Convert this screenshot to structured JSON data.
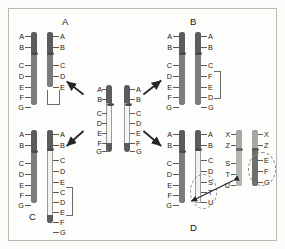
{
  "figure": {
    "background_color": "#fdfdfc",
    "border_color": "#b9b9b4"
  },
  "panels": [
    {
      "id": "panel-a",
      "letter": "A",
      "mutation_type": "deletion",
      "normal_chromosome": {
        "name": "normal",
        "loci": [
          "A",
          "B",
          "C",
          "D",
          "E",
          "F",
          "G"
        ],
        "label_side": "left"
      },
      "mutant_chromosome": {
        "name": "deleted",
        "loci": [
          "A",
          "B",
          "C",
          "D",
          "E"
        ],
        "label_side": "right"
      },
      "bracket_label": "",
      "bracket_covers": [
        "F",
        "G"
      ]
    },
    {
      "id": "panel-b",
      "letter": "B",
      "mutation_type": "inversion",
      "normal_chromosome": {
        "name": "normal",
        "loci": [
          "A",
          "B",
          "C",
          "D",
          "E",
          "F",
          "G"
        ],
        "label_side": "left"
      },
      "mutant_chromosome": {
        "name": "inverted",
        "loci": [
          "A",
          "B",
          "C",
          "F",
          "E",
          "D",
          "G"
        ],
        "label_side": "right"
      },
      "bracket_label": "",
      "bracket_covers": [
        "F",
        "E",
        "D"
      ]
    },
    {
      "id": "panel-c",
      "letter": "C",
      "mutation_type": "duplication",
      "normal_chromosome": {
        "name": "normal",
        "loci": [
          "A",
          "B",
          "C",
          "D",
          "E",
          "F",
          "G"
        ],
        "label_side": "left"
      },
      "mutant_chromosome": {
        "name": "duplicated",
        "loci": [
          "A",
          "B",
          "C",
          "D",
          "E",
          "C",
          "D",
          "E",
          "F",
          "G"
        ],
        "label_side": "right"
      },
      "bracket_label": "",
      "bracket_covers": [
        "C",
        "D",
        "E"
      ]
    },
    {
      "id": "panel-d",
      "letter": "D",
      "mutation_type": "translocation",
      "normal_chromosome": {
        "name": "normal-1",
        "loci": [
          "A",
          "B",
          "C",
          "D",
          "E",
          "F",
          "G"
        ],
        "label_side": "left"
      },
      "mutant_chromosome": {
        "name": "translocated-1",
        "loci": [
          "A",
          "B",
          "C",
          "D",
          "S",
          "T",
          "U"
        ],
        "label_side": "right",
        "highlight": [
          "S",
          "T",
          "U"
        ]
      },
      "partner_normal_chromosome": {
        "name": "normal-2",
        "loci": [
          "X",
          "Z",
          "S",
          "T",
          "U"
        ],
        "label_side": "left"
      },
      "partner_mutant_chromosome": {
        "name": "translocated-2",
        "loci": [
          "X",
          "Z",
          "E",
          "F",
          "G"
        ],
        "label_side": "right",
        "highlight": [
          "E",
          "F",
          "G"
        ]
      }
    }
  ],
  "center": {
    "name": "parent-chromosome-pair",
    "left_chromosome": {
      "loci": [
        "A",
        "B",
        "C",
        "D",
        "E",
        "F",
        "G"
      ],
      "label_side": "left"
    },
    "right_chromosome": {
      "loci": [
        "A",
        "B",
        "C",
        "D",
        "E",
        "F",
        "G"
      ],
      "label_side": "right"
    }
  },
  "arrows": [
    {
      "name": "arrow-to-panel-a",
      "from": "center",
      "to": "panel-a"
    },
    {
      "name": "arrow-to-panel-b",
      "from": "center",
      "to": "panel-b"
    },
    {
      "name": "arrow-to-panel-c",
      "from": "center",
      "to": "panel-c"
    },
    {
      "name": "arrow-to-panel-d",
      "from": "center",
      "to": "panel-d"
    },
    {
      "name": "arrow-translocation-exchange",
      "from": "panel-d-pair-1",
      "to": "panel-d-pair-2",
      "double_headed": true
    }
  ],
  "colors": {
    "chromosome_dark": "#5c5c5c",
    "chromosome_mid": "#7c7c7c",
    "chromosome_pale": "#f2f2f0",
    "outline": "#9a9a96",
    "text": "#1b1b1b",
    "arrow": "#2b2b2b",
    "dashed_highlight": "#8a8a8a"
  }
}
